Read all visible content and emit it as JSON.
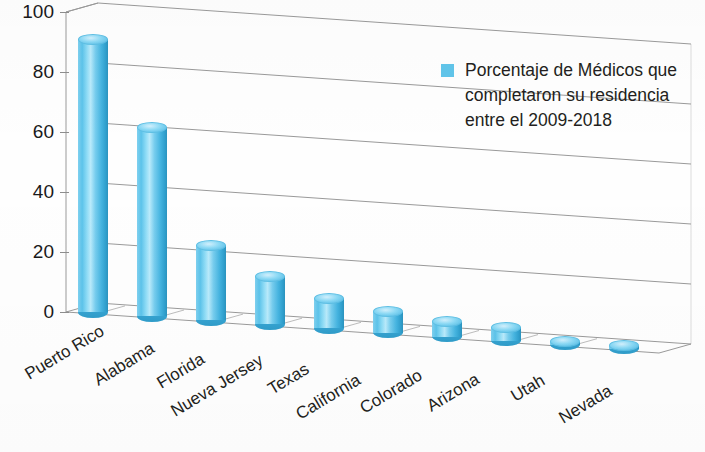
{
  "chart_data": {
    "type": "bar",
    "title": "",
    "subtitle": "",
    "xlabel": "",
    "ylabel": "",
    "ylim": [
      0,
      100
    ],
    "yticks": [
      0,
      20,
      40,
      60,
      80,
      100
    ],
    "grid": true,
    "legend_position": "right",
    "legend": [
      "Porcentaje de Médicos que completaron su residencia entre el 2009-2018"
    ],
    "categories": [
      "Puerto Rico",
      "Alabama",
      "Florida",
      "Nueva Jersey",
      "Texas",
      "California",
      "Colorado",
      "Arizona",
      "Utah",
      "Nevada"
    ],
    "series": [
      {
        "name": "Porcentaje de Médicos que completaron su residencia entre el 2009-2018",
        "values": [
          91,
          63,
          25,
          16,
          10,
          7,
          5,
          4.5,
          1,
          1
        ],
        "color": "#5bc0e8"
      }
    ]
  },
  "legend": {
    "line1": "Porcentaje de Médicos que",
    "line2": "completaron su residencia",
    "line3": "entre el 2009-2018",
    "swatch_color": "#61c5ea"
  },
  "axis": {
    "y_labels": [
      "100",
      "80",
      "60",
      "40",
      "20",
      "0"
    ]
  },
  "categories": {
    "c0": "Puerto Rico",
    "c1": "Alabama",
    "c2": "Florida",
    "c3": "Nueva Jersey",
    "c4": "Texas",
    "c5": "California",
    "c6": "Colorado",
    "c7": "Arizona",
    "c8": "Utah",
    "c9": "Nevada"
  }
}
